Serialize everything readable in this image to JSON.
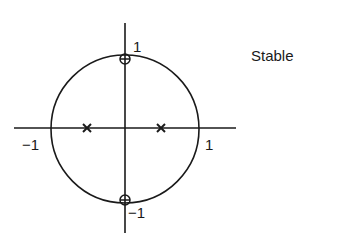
{
  "diagram": {
    "type": "pole-zero plot (z-plane)",
    "status_label": "Stable",
    "unit_circle": {
      "center": [
        0,
        0
      ],
      "radius": 1
    },
    "axis_labels": {
      "real_pos": "1",
      "real_neg": "−1",
      "imag_pos": "1",
      "imag_neg": "−1"
    },
    "poles": [
      {
        "re": -0.5,
        "im": 0,
        "marker": "x"
      },
      {
        "re": 0.5,
        "im": 0,
        "marker": "x"
      }
    ],
    "zeros": [
      {
        "re": 0,
        "im": 1,
        "marker": "circle-plus"
      },
      {
        "re": 0,
        "im": -1,
        "marker": "circle-plus"
      }
    ],
    "colors": {
      "ink": "#1a1a1a",
      "background": "#ffffff"
    }
  }
}
